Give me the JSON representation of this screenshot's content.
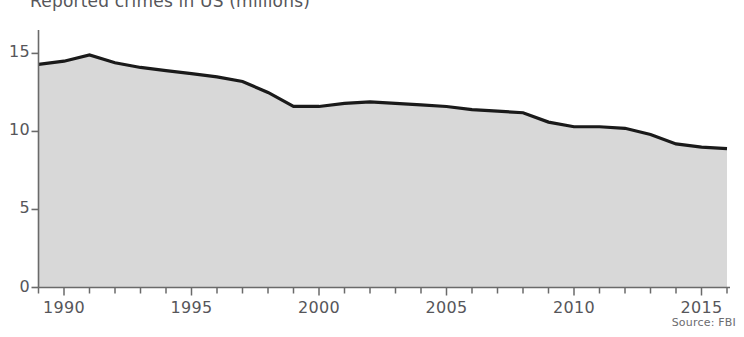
{
  "chart_data": {
    "type": "area",
    "title": "Reported crimes in US (millions)",
    "xlabel": "",
    "ylabel": "",
    "xlim": [
      1989,
      2016
    ],
    "ylim": [
      0,
      16.5
    ],
    "yticks": [
      0,
      5,
      10,
      15
    ],
    "ytick_labels": [
      "0",
      "5",
      "10",
      "15"
    ],
    "xticks": [
      1990,
      1995,
      2000,
      2005,
      2010,
      2015
    ],
    "xtick_labels": [
      "1990",
      "1995",
      "2000",
      "2005",
      "2010",
      "2015"
    ],
    "minor_xticks_every": 1,
    "grid": false,
    "legend": "none",
    "fill_color": "#d8d8d8",
    "line_color": "#1a1a1a",
    "axis_color": "#6a6a6a",
    "series": [
      {
        "name": "Reported crimes",
        "x": [
          1989,
          1990,
          1991,
          1992,
          1993,
          1994,
          1995,
          1996,
          1997,
          1998,
          1999,
          2000,
          2001,
          2002,
          2003,
          2004,
          2005,
          2006,
          2007,
          2008,
          2009,
          2010,
          2011,
          2012,
          2013,
          2014,
          2015,
          2016
        ],
        "values": [
          14.3,
          14.5,
          14.9,
          14.4,
          14.1,
          13.9,
          13.7,
          13.5,
          13.2,
          12.5,
          11.6,
          11.6,
          11.8,
          11.9,
          11.8,
          11.7,
          11.6,
          11.4,
          11.3,
          11.2,
          10.6,
          10.3,
          10.3,
          10.2,
          9.8,
          9.2,
          9.0,
          8.9
        ]
      }
    ],
    "annotations": [
      {
        "name": "source",
        "text": "Source: FBI"
      }
    ]
  }
}
